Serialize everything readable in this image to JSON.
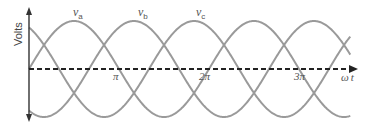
{
  "diagram": {
    "y_axis_label": "Volts",
    "x_axis_label": "ω t",
    "x_axis_label_parts": {
      "omega": "ω",
      "t": "t"
    },
    "ticks": [
      {
        "label": "π",
        "value_pi": 1
      },
      {
        "label": "2π",
        "value_pi": 2
      },
      {
        "label": "3π",
        "value_pi": 3
      }
    ],
    "series": [
      {
        "name": "va",
        "symbol": "v",
        "subscript": "a",
        "phase_deg": 0
      },
      {
        "name": "vb",
        "symbol": "v",
        "subscript": "b",
        "phase_deg": -120
      },
      {
        "name": "vc",
        "symbol": "v",
        "subscript": "c",
        "phase_deg": -240
      }
    ],
    "colors": {
      "wave": "#9a9a9a",
      "axis": "#333333",
      "baseline": "#222222",
      "text": "#555555"
    },
    "x_range_pi": [
      0,
      3.57
    ]
  }
}
